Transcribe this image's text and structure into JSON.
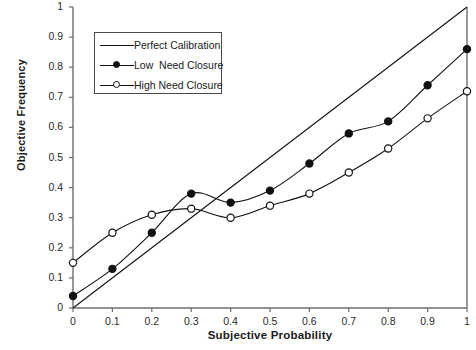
{
  "chart_data": {
    "type": "line",
    "title": "",
    "xlabel": "Subjective Probability",
    "ylabel": "Objective Frequency",
    "xlim": [
      0,
      1
    ],
    "ylim": [
      0,
      1
    ],
    "grid": false,
    "legend_position": "upper-left",
    "xticks": [
      "0",
      "0.1",
      "0.2",
      "0.3",
      "0.4",
      "0.5",
      "0.6",
      "0.7",
      "0.8",
      "0.9",
      "1"
    ],
    "yticks": [
      "0",
      "0.1",
      "0.2",
      "0.3",
      "0.4",
      "0.5",
      "0.6",
      "0.7",
      "0.8",
      "0.9",
      "1"
    ],
    "x": [
      0,
      0.1,
      0.2,
      0.3,
      0.4,
      0.5,
      0.6,
      0.7,
      0.8,
      0.9,
      1
    ],
    "series": [
      {
        "name": "Perfect Calibration",
        "marker": "none",
        "x": [
          0,
          1
        ],
        "values": [
          0,
          1
        ]
      },
      {
        "name": "Low  Need Closure",
        "marker": "filled-circle",
        "values": [
          0.04,
          0.13,
          0.25,
          0.38,
          0.35,
          0.39,
          0.48,
          0.58,
          0.62,
          0.74,
          0.86
        ]
      },
      {
        "name": "High Need Closure",
        "marker": "open-circle",
        "values": [
          0.15,
          0.25,
          0.31,
          0.33,
          0.3,
          0.34,
          0.38,
          0.45,
          0.53,
          0.63,
          0.72
        ]
      }
    ],
    "colors": {
      "line": "#111111",
      "axis": "#6e6e6e",
      "background": "#ffffff"
    }
  }
}
